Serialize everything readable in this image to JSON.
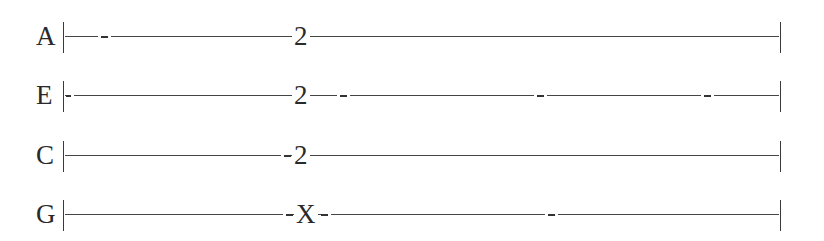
{
  "tablature": {
    "instrument_tuning": [
      "A",
      "E",
      "C",
      "G"
    ],
    "strings": [
      {
        "name": "A",
        "note": "2",
        "note_prefix_dash": false,
        "note_suffix_dash": false,
        "dash_positions": [
          104
        ]
      },
      {
        "name": "E",
        "note": "2",
        "note_prefix_dash": false,
        "note_suffix_dash": true,
        "dash_positions": [
          68,
          343,
          541,
          708
        ]
      },
      {
        "name": "C",
        "note": "2",
        "note_prefix_dash": true,
        "note_suffix_dash": false,
        "dash_positions": []
      },
      {
        "name": "G",
        "note": "X",
        "note_prefix_dash": true,
        "note_suffix_dash": true,
        "dash_positions": [
          551
        ]
      }
    ],
    "colors": {
      "text": "#2a2a2a",
      "line": "#454545",
      "background": "#ffffff"
    }
  }
}
